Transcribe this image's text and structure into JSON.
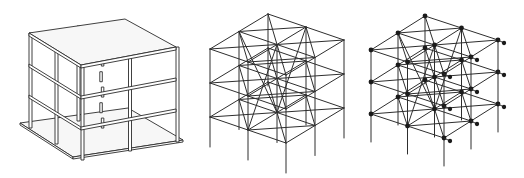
{
  "figure": {
    "background": "#ffffff",
    "line_color": "#2e2e2e",
    "node_color": "#1a1a1a",
    "panels": [
      {
        "id": "solid-building-model",
        "description": "3D rendered three-storey building with slabs, columns and base plate",
        "x": 0,
        "width": 190,
        "roof": {
          "back": [
            125,
            19
          ],
          "left": [
            29,
            33
          ],
          "right": [
            176,
            47
          ],
          "front": [
            81,
            65
          ]
        },
        "floor_height": 31,
        "storeys": 3,
        "slab_thickness": 3,
        "base": {
          "left": [
            20,
            123
          ],
          "front": [
            73,
            157
          ],
          "right": [
            183,
            140
          ],
          "back": [
            128,
            108
          ]
        }
      },
      {
        "id": "wireframe-model",
        "description": "Wireframe structural model with columns, beams and diagonal bracing",
        "x": 190,
        "width": 165,
        "origin": [
          268,
          14
        ],
        "u": [
          -29,
          17.5
        ],
        "v": [
          38,
          13
        ],
        "floor_height": 34,
        "bays_u": 2,
        "bays_v": 2,
        "floors": 3,
        "column_extension": 30,
        "nodes": false
      },
      {
        "id": "node-frame-model",
        "description": "Structural frame model with joint nodes marked as dots",
        "x": 355,
        "width": 169,
        "origin": [
          425,
          16
        ],
        "u": [
          -27,
          17
        ],
        "v": [
          36.5,
          12
        ],
        "floor_height": 32,
        "bays_u": 2,
        "bays_v": 2,
        "floors": 3,
        "column_extension": 28,
        "nodes": true,
        "node_radius": 2.4,
        "extra_node_offset": [
          6,
          3
        ]
      }
    ]
  }
}
